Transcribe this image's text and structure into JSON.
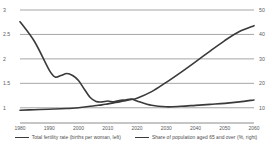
{
  "chart_data": {
    "type": "line",
    "title": "",
    "subtitle": "",
    "xlabel": "",
    "ylabel": "",
    "grid": true,
    "legend_position": "bottom",
    "x": [
      1980,
      1985,
      1990,
      1992,
      1994,
      1996,
      1998,
      2000,
      2002,
      2004,
      2006,
      2008,
      2010,
      2012,
      2014,
      2016,
      2018,
      2020,
      2025,
      2030,
      2035,
      2040,
      2045,
      2050,
      2055,
      2060
    ],
    "x_ticks": [
      "1980",
      "1990",
      "2000",
      "2010",
      "2020",
      "2030",
      "2040",
      "2050",
      "2060"
    ],
    "x_tick_values": [
      1980,
      1990,
      2000,
      2010,
      2020,
      2030,
      2040,
      2050,
      2060
    ],
    "xlim": [
      1980,
      2060
    ],
    "axes": [
      {
        "id": "left",
        "name": "Total fertility rate",
        "unit": "births per woman",
        "ylim": [
          0.75,
          3.0
        ],
        "ticks": [
          1,
          1.5,
          2,
          2.5,
          3
        ],
        "tick_labels": [
          "1",
          "1.5",
          "2",
          "2.5",
          "3"
        ]
      },
      {
        "id": "right",
        "name": "Share of population aged 65 and over",
        "unit": "%",
        "ylim": [
          5,
          50
        ],
        "ticks": [
          10,
          20,
          30,
          40,
          50
        ],
        "tick_labels": [
          "10",
          "20",
          "30",
          "40",
          "50"
        ]
      }
    ],
    "series": [
      {
        "name": "Total fertility rate (births per woman, left)",
        "axis": "left",
        "color": "#3a3a3a",
        "values": [
          2.76,
          2.35,
          1.77,
          1.63,
          1.66,
          1.7,
          1.66,
          1.56,
          1.38,
          1.21,
          1.13,
          1.12,
          1.14,
          1.12,
          1.15,
          1.16,
          1.18,
          1.14,
          1.05,
          1.02,
          1.03,
          1.05,
          1.07,
          1.09,
          1.12,
          1.16
        ]
      },
      {
        "name": "Share of population aged 65 and over (%, right)",
        "axis": "right",
        "color": "#3a3a3a",
        "values": [
          9.0,
          9.2,
          9.4,
          9.5,
          9.6,
          9.7,
          9.8,
          10.0,
          10.3,
          10.6,
          10.9,
          11.2,
          11.6,
          12.0,
          12.4,
          12.9,
          13.4,
          13.9,
          16.6,
          20.4,
          24.5,
          28.8,
          33.2,
          37.5,
          41.2,
          43.6
        ]
      }
    ]
  },
  "legend": {
    "items": [
      {
        "label": "Total fertility rate (births per woman, left)"
      },
      {
        "label": "Share of population aged 65 and over (%, right)"
      }
    ]
  }
}
